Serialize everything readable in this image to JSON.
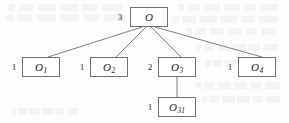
{
  "figure": {
    "type": "tree-diagram",
    "background_color": "#fdfdfc",
    "stroke_color": "#6f7176",
    "text_color": "#1b1b1b"
  },
  "nodes": {
    "root": {
      "id": "O",
      "base": "O",
      "subscript": "",
      "weight": "3",
      "x": 130,
      "y": 7,
      "w": 38,
      "h": 20,
      "weight_x": 118,
      "weight_y": 13
    },
    "child1": {
      "id": "O1",
      "base": "O",
      "subscript": "1",
      "weight": "1",
      "x": 22,
      "y": 57,
      "w": 38,
      "h": 20,
      "weight_x": 12,
      "weight_y": 63
    },
    "child2": {
      "id": "O2",
      "base": "O",
      "subscript": "2",
      "weight": "1",
      "x": 90,
      "y": 57,
      "w": 38,
      "h": 20,
      "weight_x": 80,
      "weight_y": 63
    },
    "child3": {
      "id": "O3",
      "base": "O",
      "subscript": "3",
      "weight": "2",
      "x": 158,
      "y": 57,
      "w": 38,
      "h": 20,
      "weight_x": 148,
      "weight_y": 63
    },
    "child4": {
      "id": "O4",
      "base": "O",
      "subscript": "4",
      "weight": "1",
      "x": 238,
      "y": 57,
      "w": 38,
      "h": 20,
      "weight_x": 228,
      "weight_y": 63
    },
    "grandchild31": {
      "id": "O31",
      "base": "O",
      "subscript": "31",
      "weight": "1",
      "x": 158,
      "y": 97,
      "w": 38,
      "h": 20,
      "weight_x": 148,
      "weight_y": 103
    }
  },
  "edges": [
    {
      "name": "root-to-o1",
      "from": "O",
      "to": "O1",
      "x1": 142,
      "y1": 27,
      "x2": 48,
      "y2": 57
    },
    {
      "name": "root-to-o2",
      "from": "O",
      "to": "O2",
      "x1": 146,
      "y1": 27,
      "x2": 116,
      "y2": 57
    },
    {
      "name": "root-to-o3",
      "from": "O",
      "to": "O3",
      "x1": 151,
      "y1": 27,
      "x2": 181,
      "y2": 57
    },
    {
      "name": "root-to-o4",
      "from": "O",
      "to": "O4",
      "x1": 155,
      "y1": 27,
      "x2": 262,
      "y2": 57
    },
    {
      "name": "o3-to-o31",
      "from": "O3",
      "to": "O31",
      "x1": 177,
      "y1": 77,
      "x2": 177,
      "y2": 97
    }
  ],
  "ghost_text_rows": [
    {
      "top": 4,
      "left": 8,
      "width": 120
    },
    {
      "top": 14,
      "left": 6,
      "width": 126
    },
    {
      "top": 4,
      "left": 178,
      "width": 105
    },
    {
      "top": 16,
      "left": 172,
      "width": 112
    },
    {
      "top": 28,
      "left": 186,
      "width": 96
    },
    {
      "top": 44,
      "left": 196,
      "width": 86
    },
    {
      "top": 60,
      "left": 206,
      "width": 76
    },
    {
      "top": 82,
      "left": 196,
      "width": 88
    },
    {
      "top": 96,
      "left": 202,
      "width": 82
    },
    {
      "top": 108,
      "left": 12,
      "width": 70
    }
  ]
}
